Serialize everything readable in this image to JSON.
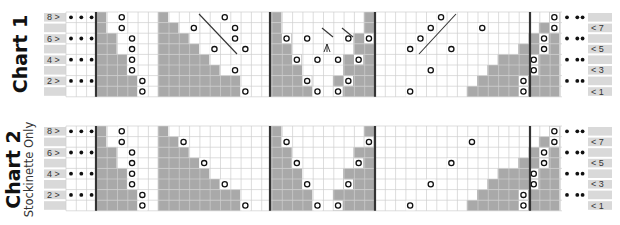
{
  "colors": {
    "gray": "#a9a9a9",
    "grid": "#cfcfcf",
    "label_bg": "#d9d9d9",
    "thick_line": "#333333",
    "ink": "#111111"
  },
  "charts": [
    {
      "id": "chart1",
      "title": "Chart 1",
      "subtitle": "",
      "top": 12,
      "left_labels": [
        "8 >",
        "",
        "6 >",
        "",
        "4 >",
        "",
        "2 >",
        ""
      ],
      "right_labels": [
        "",
        "< 7",
        "",
        "< 5",
        "",
        "< 3",
        "",
        "< 1"
      ],
      "dot_rows": [
        0,
        2,
        4,
        6
      ],
      "rows": [
        "11o000|1111000000000o000|000000000000000011|0000000000000o0001|000000o0",
        "11o000|1111100o0000000o00|0000o00000000o00011|00000000000o0000o11|00000o01",
        "1111o0|11111100000o0000o|001o0000000000o011|0000000o0000o0111|0000o011",
        "1111o0|111111100o000000o|0000000000000000011|000000o000o011111|000o0111",
        "11111o|1111111100000000|1110000000000000111|00000000000111111|000o0111",
        "11111o|11111111100o0000|11100000000000000111|0000000000111111|00o01111",
        "111111o|1111111111100000|1111000000000001111|0000000o1111111|0o011111",
        "111111o|111111111111100o0|11111o00o1111111|000o111111111111|0o011111"
      ]
    }
  ],
  "chart1": {
    "title": "Chart 1",
    "left_labels": [
      "8 >",
      "6 >",
      "4 >",
      "2 >"
    ],
    "right_labels": [
      "< 7",
      "< 5",
      "< 3",
      "< 1"
    ],
    "sections": [
      "A",
      "B",
      "C",
      "D"
    ],
    "yarn_overs": 26,
    "decrease_lines": 4
  },
  "chart2": {
    "title": "Chart 2",
    "subtitle": "Stockinette Only",
    "left_labels": [
      "8 >",
      "6 >",
      "4 >",
      "2 >"
    ],
    "right_labels": [
      "< 7",
      "< 5",
      "< 3",
      "< 1"
    ],
    "yarn_overs": 20
  }
}
